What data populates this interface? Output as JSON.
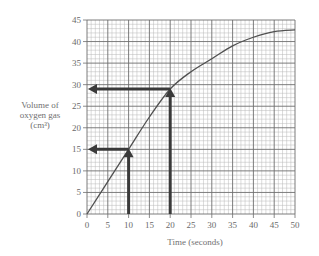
{
  "chart_data": {
    "type": "line",
    "title": "",
    "xlabel": "Time (seconds)",
    "ylabel_lines": [
      "Volume of",
      "oxygen gas",
      "(cm³)"
    ],
    "xlim": [
      0,
      50
    ],
    "ylim": [
      0,
      45
    ],
    "xticks": [
      0,
      5,
      10,
      15,
      20,
      25,
      30,
      35,
      40,
      45,
      50
    ],
    "yticks": [
      0,
      5,
      10,
      15,
      20,
      25,
      30,
      35,
      40,
      45
    ],
    "grid": {
      "major_step": 5,
      "minor_step": 1
    },
    "series": [
      {
        "name": "Volume of oxygen gas",
        "x": [
          0,
          5,
          10,
          15,
          20,
          25,
          30,
          35,
          40,
          45,
          50
        ],
        "y": [
          0,
          7.5,
          15,
          22.5,
          29,
          33,
          36,
          39,
          41,
          42.3,
          42.7
        ]
      }
    ],
    "annotations": [
      {
        "type": "arrow-reading",
        "x": 10,
        "y": 15
      },
      {
        "type": "arrow-reading",
        "x": 20,
        "y": 29
      }
    ],
    "legend": null
  },
  "colors": {
    "minor_grid": "#b8b8b8",
    "major_grid": "#6e6e6e",
    "curve": "#505050",
    "arrow": "#3a3a3a",
    "text": "#6a6a6a"
  }
}
